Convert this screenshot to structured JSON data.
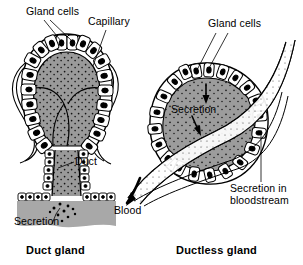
{
  "figure": {
    "background_color": "#ffffff",
    "ink_color": "#000000",
    "cytoplasm_fill": "#9a9a9a",
    "lumen_fill": "#8f8f8f",
    "cell_fill": "#ffffff",
    "nucleus_fill": "#000000",
    "secretion_pool_fill": "#a8a8a8"
  },
  "panels": [
    {
      "id": "duct-gland",
      "caption": "Duct gland",
      "labels": [
        {
          "id": "gland-cells",
          "text": "Gland cells"
        },
        {
          "id": "capillary",
          "text": "Capillary"
        },
        {
          "id": "duct",
          "text": "Duct"
        },
        {
          "id": "secretion",
          "text": "Secretion"
        }
      ],
      "structures": [
        "acinus ring of columnar gland cells with basal nuclei",
        "stippled secretory lumen",
        "capillary wrapping the acinus",
        "duct lined with cells leading downward",
        "secretion pool on surface"
      ]
    },
    {
      "id": "ductless-gland",
      "caption": "Ductless gland",
      "labels": [
        {
          "id": "gland-cells",
          "text": "Gland cells"
        },
        {
          "id": "secretion",
          "text": "Secretion"
        },
        {
          "id": "blood",
          "text": "Blood"
        },
        {
          "id": "secretion-in-bloodstream",
          "text": "Secretion in\nbloodstream"
        }
      ],
      "structures": [
        "rounded gland mass ringed by columnar cells",
        "stippled secretory cytoplasm",
        "blood vessel passing diagonally through gland",
        "arrows showing secretion entering blood",
        "vessel carrying secretion away"
      ]
    }
  ]
}
